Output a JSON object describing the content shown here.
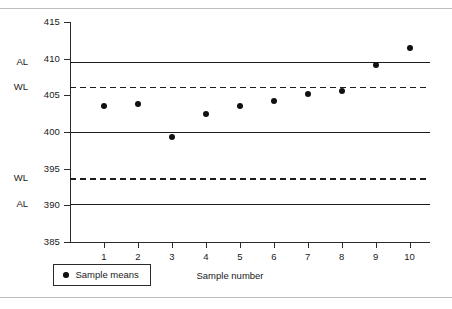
{
  "figure": {
    "background": "#ffffff",
    "rule_color": "#b9bcc0",
    "ink_color": "#1a1a1a"
  },
  "legend": {
    "marker_label": "Sample means",
    "marker_icon": "filled-circle-marker"
  },
  "chart_data": {
    "type": "scatter",
    "title": "",
    "subtitle": "",
    "xlabel": "Sample number",
    "ylabel": "",
    "x": [
      1,
      2,
      3,
      4,
      5,
      6,
      7,
      8,
      9,
      10
    ],
    "categories": [
      "1",
      "2",
      "3",
      "4",
      "5",
      "6",
      "7",
      "8",
      "9",
      "10"
    ],
    "series": [
      {
        "name": "Sample means",
        "marker": "filled-circle",
        "color": "#111111",
        "values": [
          403.6,
          403.8,
          399.3,
          402.5,
          403.6,
          404.2,
          405.2,
          405.6,
          409.2,
          411.5
        ]
      }
    ],
    "ylim": [
      385,
      415
    ],
    "xlim": [
      0,
      10.6
    ],
    "yticks": [
      385,
      390,
      395,
      400,
      405,
      410,
      415
    ],
    "ytick_labels": [
      "385",
      "390",
      "395",
      "400",
      "405",
      "410",
      "415"
    ],
    "xticks": [
      1,
      2,
      3,
      4,
      5,
      6,
      7,
      8,
      9,
      10
    ],
    "xtick_labels": [
      "1",
      "2",
      "3",
      "4",
      "5",
      "6",
      "7",
      "8",
      "9",
      "10"
    ],
    "grid": false,
    "legend_position": "below-left",
    "control_lines": [
      {
        "id": "upper-action-limit",
        "label": "AL",
        "value": 409.5,
        "style": "solid",
        "color": "#1c1c1c"
      },
      {
        "id": "upper-warning-limit",
        "label": "WL",
        "value": 406.2,
        "style": "dashed",
        "color": "#1c1c1c"
      },
      {
        "id": "center-line",
        "label": "",
        "value": 400.0,
        "style": "solid",
        "color": "#1c1c1c"
      },
      {
        "id": "lower-warning-limit",
        "label": "WL",
        "value": 393.7,
        "style": "dashed",
        "color": "#1c1c1c"
      },
      {
        "id": "lower-action-limit",
        "label": "AL",
        "value": 390.2,
        "style": "solid",
        "color": "#1c1c1c"
      }
    ]
  }
}
